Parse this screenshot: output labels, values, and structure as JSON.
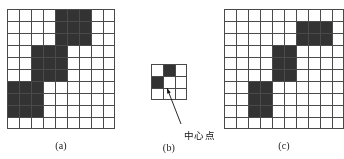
{
  "figure": {
    "background_color": "#ffffff",
    "fill_color": "#333333",
    "grid_line_color": "#4a4a4a",
    "cell_size": 12,
    "panels": [
      {
        "id": "a",
        "caption": "(a)",
        "x": 7,
        "y": 9,
        "cols": 9,
        "rows": 10,
        "name": "grid-panel-a",
        "filled_cells": [
          [
            1,
            5
          ],
          [
            1,
            6
          ],
          [
            1,
            7
          ],
          [
            2,
            5
          ],
          [
            2,
            6
          ],
          [
            2,
            7
          ],
          [
            3,
            5
          ],
          [
            3,
            6
          ],
          [
            3,
            7
          ],
          [
            4,
            3
          ],
          [
            4,
            4
          ],
          [
            4,
            5
          ],
          [
            5,
            3
          ],
          [
            5,
            4
          ],
          [
            5,
            5
          ],
          [
            6,
            3
          ],
          [
            6,
            4
          ],
          [
            6,
            5
          ],
          [
            7,
            1
          ],
          [
            7,
            2
          ],
          [
            7,
            3
          ],
          [
            8,
            1
          ],
          [
            8,
            2
          ],
          [
            8,
            3
          ],
          [
            9,
            1
          ],
          [
            9,
            2
          ],
          [
            9,
            3
          ]
        ]
      },
      {
        "id": "b",
        "caption": "(b)",
        "x": 151,
        "y": 64,
        "cols": 3,
        "rows": 3,
        "name": "grid-panel-b",
        "filled_cells": [
          [
            1,
            2
          ],
          [
            2,
            1
          ]
        ]
      },
      {
        "id": "c",
        "caption": "(c)",
        "x": 224,
        "y": 9,
        "cols": 10,
        "rows": 10,
        "name": "grid-panel-c",
        "filled_cells": [
          [
            2,
            7
          ],
          [
            2,
            8
          ],
          [
            2,
            9
          ],
          [
            3,
            7
          ],
          [
            3,
            8
          ],
          [
            3,
            9
          ],
          [
            4,
            5
          ],
          [
            4,
            6
          ],
          [
            5,
            5
          ],
          [
            5,
            6
          ],
          [
            6,
            5
          ],
          [
            6,
            6
          ],
          [
            7,
            3
          ],
          [
            7,
            4
          ],
          [
            8,
            3
          ],
          [
            8,
            4
          ],
          [
            9,
            3
          ],
          [
            9,
            4
          ]
        ]
      }
    ]
  },
  "annotation": {
    "center_point_label": "中心点",
    "label_x": 184,
    "label_y": 128,
    "arrow_from_x": 181,
    "arrow_from_y": 124,
    "arrow_to_x": 167,
    "arrow_to_y": 88
  },
  "captions": {
    "a": {
      "text": "(a)",
      "x": 61,
      "y": 140
    },
    "b": {
      "text": "(b)",
      "x": 169,
      "y": 142
    },
    "c": {
      "text": "(c)",
      "x": 284,
      "y": 140
    }
  }
}
